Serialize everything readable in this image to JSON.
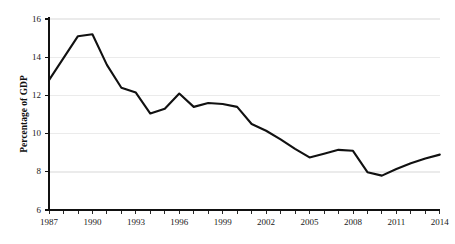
{
  "chart_data": {
    "type": "line",
    "title": "",
    "subtitle": "",
    "xlabel": "",
    "ylabel": "Percentage of GDP",
    "xlim": [
      1987,
      2014
    ],
    "ylim": [
      6,
      16
    ],
    "grid": "horizontal",
    "legend": "none",
    "line_color": "#111111",
    "grid_color": "#ebebeb",
    "axis_color": "#111111",
    "background_color": "#ffffff",
    "y_ticks": [
      6,
      8,
      10,
      12,
      14,
      16
    ],
    "y_tick_labels": [
      "6",
      "8",
      "10",
      "12",
      "14",
      "16"
    ],
    "x_ticks": [
      1987,
      1990,
      1993,
      1996,
      1999,
      2002,
      2005,
      2008,
      2011,
      2014
    ],
    "x_tick_labels": [
      "1987",
      "1990",
      "1993",
      "1996",
      "1999",
      "2002",
      "2005",
      "2008",
      "2011",
      "2014"
    ],
    "x_minor_ticks": [
      1987,
      1988,
      1989,
      1990,
      1991,
      1992,
      1993,
      1994,
      1995,
      1996,
      1997,
      1998,
      1999,
      2000,
      2001,
      2002,
      2003,
      2004,
      2005,
      2006,
      2007,
      2008,
      2009,
      2010,
      2011,
      2012,
      2013,
      2014
    ],
    "series": [
      {
        "name": "Percentage of GDP",
        "x": [
          1987,
          1988,
          1989,
          1990,
          1991,
          1992,
          1993,
          1994,
          1995,
          1996,
          1997,
          1998,
          1999,
          2000,
          2001,
          2002,
          2003,
          2004,
          2005,
          2006,
          2007,
          2008,
          2009,
          2010,
          2011,
          2012,
          2013,
          2014
        ],
        "values": [
          12.8,
          13.95,
          15.1,
          15.2,
          13.6,
          12.4,
          12.15,
          11.05,
          11.3,
          12.1,
          11.4,
          11.6,
          11.55,
          11.4,
          10.5,
          10.15,
          9.7,
          9.2,
          8.75,
          8.95,
          9.15,
          9.1,
          7.98,
          7.8,
          8.15,
          8.45,
          8.7,
          8.9
        ]
      }
    ]
  }
}
